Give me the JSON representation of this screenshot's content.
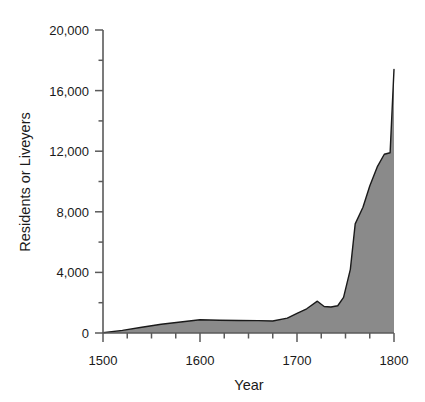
{
  "chart_data": {
    "type": "area",
    "title": "",
    "subtitle": "",
    "xlabel": "Year",
    "ylabel": "Residents or Liveyers",
    "xlim": [
      1500,
      1800
    ],
    "ylim": [
      0,
      20000
    ],
    "grid": false,
    "legend": null,
    "series_fill_color": "#8a8a8a",
    "series_line_color": "#1a1a1a",
    "axis_color": "#5a5a5a",
    "background_color": "#ffffff",
    "x_major_ticks": [
      1500,
      1600,
      1700,
      1800
    ],
    "x_major_tick_labels": [
      "1500",
      "1600",
      "1700",
      "1800"
    ],
    "x_minor_ticks": [
      1525,
      1550,
      1575,
      1625,
      1650,
      1675,
      1725,
      1750,
      1775
    ],
    "y_major_ticks": [
      0,
      4000,
      8000,
      12000,
      16000,
      20000
    ],
    "y_major_tick_labels": [
      "0",
      "4,000",
      "8,000",
      "12,000",
      "16,000",
      "20,000"
    ],
    "y_minor_ticks": [
      2000,
      6000,
      10000,
      14000,
      18000
    ],
    "x": [
      1500,
      1520,
      1540,
      1560,
      1580,
      1600,
      1620,
      1640,
      1660,
      1675,
      1690,
      1700,
      1710,
      1721,
      1728,
      1735,
      1742,
      1748,
      1755,
      1760,
      1768,
      1775,
      1783,
      1790,
      1796,
      1800
    ],
    "values": [
      20,
      170,
      380,
      580,
      730,
      870,
      840,
      830,
      820,
      790,
      980,
      1300,
      1600,
      2100,
      1750,
      1720,
      1800,
      2350,
      4200,
      7200,
      8300,
      9700,
      11000,
      11800,
      11900,
      17400
    ],
    "annotations": []
  },
  "axis": {
    "y_title": "Residents or Liveyers",
    "x_title": "Year"
  }
}
